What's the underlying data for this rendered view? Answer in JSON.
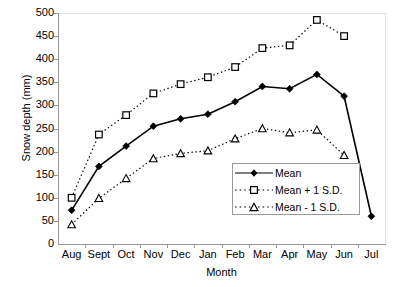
{
  "chart_data": {
    "type": "line",
    "title": "",
    "xlabel": "Month",
    "ylabel": "Snow depth (mm)",
    "categories": [
      "Aug",
      "Sept",
      "Oct",
      "Nov",
      "Dec",
      "Jan",
      "Feb",
      "Mar",
      "Apr",
      "May",
      "Jun",
      "Jul"
    ],
    "ylim": [
      0,
      500
    ],
    "ytick_values": [
      0,
      50,
      100,
      150,
      200,
      250,
      300,
      350,
      400,
      450,
      500
    ],
    "grid": false,
    "legend_position": "inside-lower-right",
    "series": [
      {
        "name": "Mean",
        "marker": "filled-diamond",
        "line": "solid",
        "values": [
          73,
          168,
          212,
          255,
          271,
          281,
          308,
          341,
          336,
          367,
          320,
          60
        ]
      },
      {
        "name": "Mean + 1 S.D.",
        "marker": "open-square",
        "line": "dotted",
        "values": [
          100,
          237,
          279,
          326,
          346,
          361,
          383,
          424,
          430,
          485,
          450,
          null
        ]
      },
      {
        "name": "Mean - 1 S.D.",
        "marker": "open-triangle",
        "line": "dotted",
        "values": [
          42,
          99,
          142,
          185,
          196,
          202,
          228,
          250,
          241,
          247,
          192,
          null
        ]
      }
    ]
  },
  "legend": {
    "items": [
      {
        "label": "Mean"
      },
      {
        "label": "Mean + 1 S.D."
      },
      {
        "label": "Mean - 1 S.D."
      }
    ]
  }
}
